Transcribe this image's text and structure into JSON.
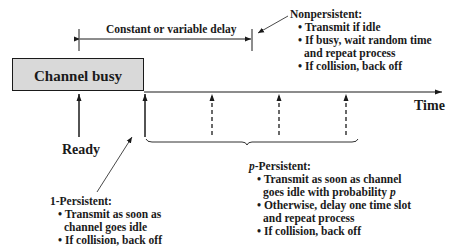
{
  "diagram": {
    "channel_box": {
      "label": "Channel busy",
      "fill": "#d9d9d9"
    },
    "delay_span": {
      "label": "Constant or variable delay"
    },
    "time_axis": {
      "label": "Time"
    },
    "ready_label": "Ready",
    "nonpersistent": {
      "title": "Nonpersistent:",
      "bullets": [
        {
          "line1": "• Transmit if idle"
        },
        {
          "line1": "• If busy, wait random time",
          "line2": "and repeat process"
        },
        {
          "line1": "• If collision, back off"
        }
      ]
    },
    "one_persistent": {
      "title": "1-Persistent:",
      "bullets": [
        {
          "line1": "• Transmit as soon as",
          "line2": "channel goes idle"
        },
        {
          "line1": "• If collision, back off"
        }
      ]
    },
    "p_persistent": {
      "title_italic": "p",
      "title_rest": "-Persistent:",
      "bullets": [
        {
          "line1": "• Transmit as soon as channel",
          "line2_text": "goes idle with probability ",
          "line2_italic": "p"
        },
        {
          "line1": "• Otherwise, delay one time slot",
          "line2": "and repeat process"
        },
        {
          "line1": "• If collision, back off"
        }
      ]
    },
    "colors": {
      "stroke": "#1a1a1a",
      "box_fill": "#d9d9d9",
      "background": "#ffffff"
    }
  }
}
